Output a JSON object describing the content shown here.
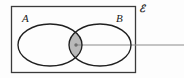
{
  "figure": {
    "kind": "venn-diagram",
    "width": 184,
    "height": 78,
    "background_color": "#fdfdfd"
  },
  "universal_set": {
    "label": "ℰ",
    "name": "universal-set",
    "border_color": "#3a3a3a",
    "rect": {
      "x": 11,
      "y": 6,
      "width": 125,
      "height": 67
    }
  },
  "sets": [
    {
      "id": "A",
      "label": "A",
      "name": "set-a",
      "stroke_color": "#1f1f1f",
      "fill": "none",
      "ellipse": {
        "cx": 50,
        "cy": 45,
        "rx": 32,
        "ry": 21
      }
    },
    {
      "id": "B",
      "label": "B",
      "name": "set-b",
      "stroke_color": "#1f1f1f",
      "fill": "none",
      "ellipse": {
        "cx": 100,
        "cy": 45,
        "rx": 31,
        "ry": 21
      }
    }
  ],
  "intersection": {
    "label": "",
    "name": "intersection-region",
    "fill_color": "#b9b9b9",
    "stroke_color": "#1f1f1f",
    "center": {
      "x": 76,
      "y": 45
    }
  },
  "leader_line": {
    "name": "leader-line",
    "color": "#8c8c8c",
    "from": {
      "x": 76,
      "y": 45
    },
    "to": {
      "x": 184,
      "y": 45
    },
    "dot_color": "#6f6f6f"
  }
}
